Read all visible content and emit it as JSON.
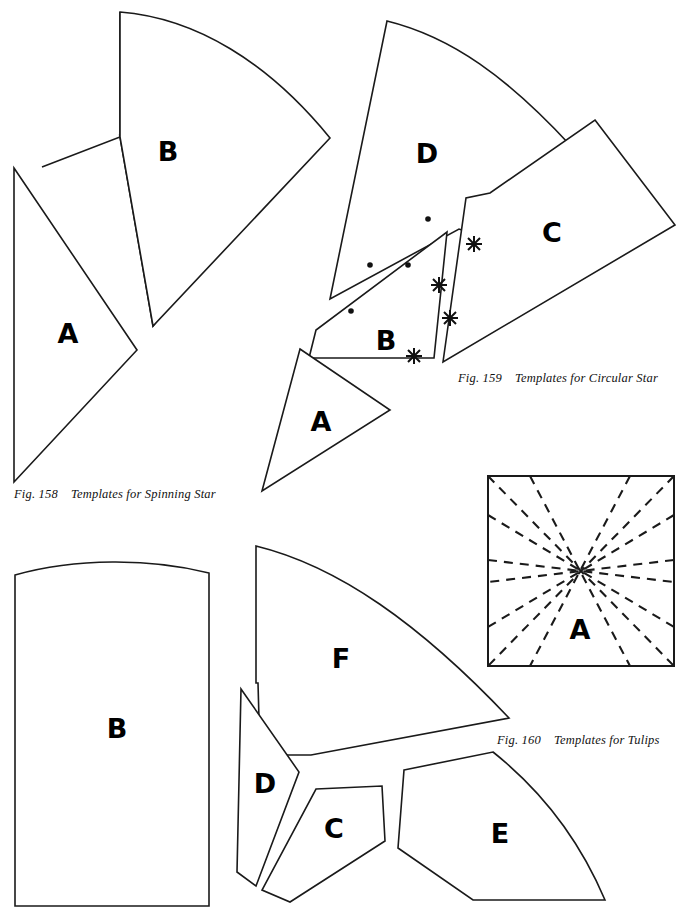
{
  "page": {
    "width": 691,
    "height": 913,
    "background": "#ffffff",
    "ink_color": "#1a1a1a",
    "kind": "quilting template pattern plate"
  },
  "figures": [
    {
      "id": "fig-158",
      "number": "Fig. 158",
      "title": "Templates for Spinning Star",
      "caption_x": 14,
      "caption_y": 487,
      "pieces": [
        {
          "label": "A",
          "label_x": 68,
          "label_y": 333
        },
        {
          "label": "B",
          "label_x": 168,
          "label_y": 151
        }
      ]
    },
    {
      "id": "fig-159",
      "number": "Fig. 159",
      "title": "Templates for Circular Star",
      "caption_x": 458,
      "caption_y": 371,
      "pieces": [
        {
          "label": "A",
          "label_x": 321,
          "label_y": 421
        },
        {
          "label": "B",
          "label_x": 386,
          "label_y": 340
        },
        {
          "label": "C",
          "label_x": 552,
          "label_y": 232
        },
        {
          "label": "D",
          "label_x": 427,
          "label_y": 153
        }
      ],
      "seam_marks": {
        "dots": [
          {
            "x": 428,
            "y": 219
          },
          {
            "x": 408,
            "y": 265
          },
          {
            "x": 370,
            "y": 265
          },
          {
            "x": 351,
            "y": 311
          }
        ],
        "crosses": [
          {
            "x": 474,
            "y": 244
          },
          {
            "x": 439,
            "y": 285
          },
          {
            "x": 450,
            "y": 318
          },
          {
            "x": 414,
            "y": 356
          }
        ]
      }
    },
    {
      "id": "fig-160",
      "number": "Fig. 160",
      "title": "Templates for Tulips",
      "caption_x": 497,
      "caption_y": 733,
      "pieces": [
        {
          "label": "A",
          "label_x": 580,
          "label_y": 629
        },
        {
          "label": "B",
          "label_x": 117,
          "label_y": 728
        },
        {
          "label": "C",
          "label_x": 334,
          "label_y": 828
        },
        {
          "label": "D",
          "label_x": 265,
          "label_y": 783
        },
        {
          "label": "E",
          "label_x": 500,
          "label_y": 833
        },
        {
          "label": "F",
          "label_x": 341,
          "label_y": 658
        }
      ],
      "block_diagram": {
        "frame": {
          "x": 487,
          "y": 475,
          "width": 188,
          "height": 192
        },
        "center": {
          "x": 580,
          "y": 572
        },
        "fold_lines": 8,
        "line_style": "dashed"
      }
    }
  ]
}
